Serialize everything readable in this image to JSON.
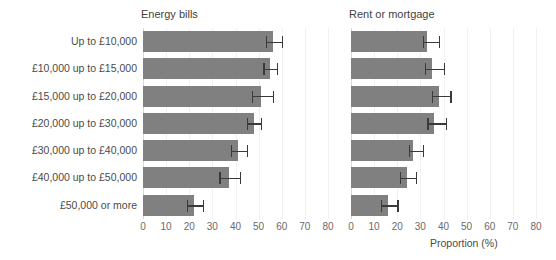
{
  "chart_data": {
    "type": "bar",
    "orientation": "horizontal",
    "title": "",
    "xlabel": "Proportion (%)",
    "ylabel": "",
    "xlim": [
      0,
      80
    ],
    "xticks": [
      0,
      10,
      20,
      30,
      40,
      50,
      60,
      70,
      80
    ],
    "grid": true,
    "legend": false,
    "bar_color": "#808080",
    "error_bar_color": "#3a3a3a",
    "categories": [
      "Up to £10,000",
      "£10,000 up to £15,000",
      "£15,000 up to £20,000",
      "£20,000 up to £30,000",
      "£30,000 up to £40,000",
      "£40,000 up to £50,000",
      "£50,000 or more"
    ],
    "panels": [
      {
        "title": "Energy bills",
        "values": [
          56,
          55,
          51,
          48,
          41,
          37,
          22
        ],
        "err_low": [
          53,
          52,
          47,
          45,
          38,
          33,
          19
        ],
        "err_high": [
          60,
          58,
          56,
          51,
          45,
          42,
          26
        ]
      },
      {
        "title": "Rent or mortgage",
        "values": [
          33,
          35,
          38,
          36,
          27,
          24,
          16
        ],
        "err_low": [
          31,
          32,
          35,
          33,
          25,
          21,
          13
        ],
        "err_high": [
          38,
          40,
          43,
          41,
          31,
          28,
          20
        ]
      }
    ]
  }
}
